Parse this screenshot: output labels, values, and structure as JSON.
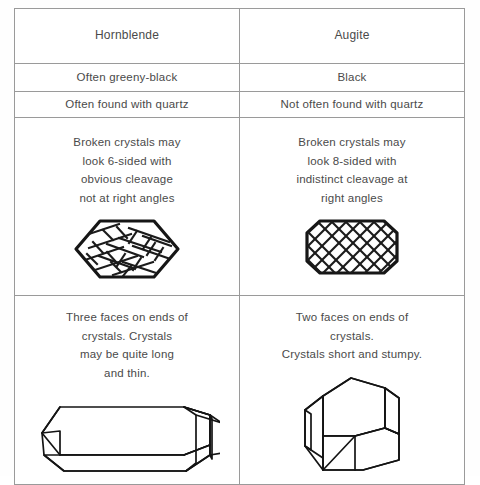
{
  "table": {
    "columns": [
      {
        "name": "hornblende",
        "header": "Hornblende"
      },
      {
        "name": "augite",
        "header": "Augite"
      }
    ],
    "rows": [
      {
        "name": "colour",
        "hornblende": "Often greeny-black",
        "augite": "Black"
      },
      {
        "name": "association",
        "hornblende": "Often found with quartz",
        "augite": "Not often found with quartz"
      },
      {
        "name": "cleavage",
        "hornblende": "Broken crystals may\nlook 6-sided with\nobvious cleavage\nnot at right angles",
        "augite": "Broken crystals may\nlook 8-sided with\nindistinct cleavage at\nright angles",
        "hornblende_figure": "hornblende-cross-section",
        "augite_figure": "augite-cross-section"
      },
      {
        "name": "crystal-habit",
        "hornblende": "Three faces on ends of\ncrystals. Crystals\nmay be quite long\nand thin.",
        "augite": "Two faces on ends of\ncrystals.\nCrystals short and stumpy.",
        "hornblende_figure": "hornblende-prism",
        "augite_figure": "augite-prism"
      }
    ]
  },
  "colors": {
    "text": "#4a4a4a",
    "border": "#9a9a9a",
    "ink": "#161616",
    "background": "#ffffff"
  }
}
